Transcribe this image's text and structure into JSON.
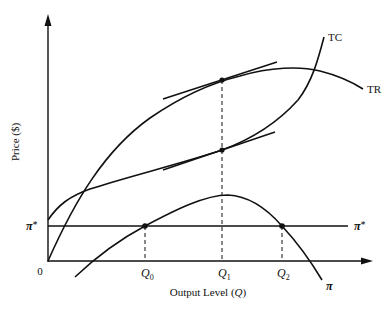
{
  "diagram": {
    "type": "economics-profit-maximization",
    "y_axis_label": "Price ($)",
    "x_axis_label_prefix": "Output Level (",
    "x_axis_label_var": "Q",
    "x_axis_label_suffix": ")",
    "origin_label": "0",
    "curves": {
      "tc": {
        "label": "TC"
      },
      "tr": {
        "label": "TR"
      },
      "profit": {
        "label": "π"
      }
    },
    "profit_target": {
      "label": "π",
      "sup": "*"
    },
    "quantities": [
      {
        "name": "Q0",
        "label": "Q",
        "sub": "0"
      },
      {
        "name": "Q1",
        "label": "Q",
        "sub": "1"
      },
      {
        "name": "Q2",
        "label": "Q",
        "sub": "2"
      }
    ],
    "colors": {
      "ink": "#111111",
      "background": "#ffffff"
    }
  }
}
